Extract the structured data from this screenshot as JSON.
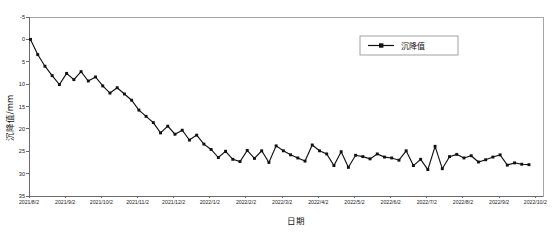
{
  "chart_data": {
    "type": "line",
    "title": "",
    "xlabel": "日期",
    "ylabel": "沉降值/mm",
    "y_inverted": true,
    "ylim": [
      -5,
      35
    ],
    "yticks": [
      -5,
      0,
      5,
      10,
      15,
      20,
      25,
      30,
      35
    ],
    "ytick_labels": [
      "-5",
      "0",
      "5",
      "10",
      "15",
      "20",
      "25",
      "30",
      "35"
    ],
    "grid": false,
    "legend_position": "upper-right",
    "legend": [
      "沉降值"
    ],
    "xtick_labels": [
      "2021/8/2",
      "2021/9/2",
      "2021/10/2",
      "2021/11/2",
      "2021/12/2",
      "2022/1/2",
      "2022/2/2",
      "2022/3/2",
      "2022/4/2",
      "2022/5/2",
      "2022/6/2",
      "2022/7/2",
      "2022/8/2",
      "2022/9/2",
      "2022/10/2"
    ],
    "series": [
      {
        "name": "沉降值",
        "values": [
          0.0,
          3.4,
          6.0,
          8.1,
          10.1,
          7.6,
          9.0,
          7.2,
          9.3,
          8.4,
          10.4,
          12.0,
          10.8,
          12.2,
          13.6,
          15.8,
          17.2,
          18.6,
          20.9,
          19.4,
          21.2,
          20.3,
          22.5,
          21.4,
          23.4,
          24.6,
          26.4,
          25.0,
          26.8,
          27.3,
          24.8,
          26.6,
          24.9,
          27.5,
          23.8,
          24.9,
          25.8,
          26.5,
          27.2,
          23.6,
          24.9,
          25.6,
          28.2,
          25.1,
          28.6,
          25.9,
          26.2,
          26.7,
          25.6,
          26.3,
          26.5,
          27.0,
          24.9,
          28.2,
          26.8,
          29.1,
          23.9,
          28.9,
          26.2,
          25.7,
          26.5,
          26.0,
          27.4,
          26.9,
          26.3,
          25.8,
          28.1,
          27.6,
          27.9,
          28.0
        ]
      }
    ],
    "x_values": [
      "2021/8/2",
      "2021/8/7",
      "2021/8/12",
      "2021/8/17",
      "2021/8/22",
      "2021/8/25",
      "2021/8/28",
      "2021/8/31",
      "2021/9/3",
      "2021/9/6",
      "2021/9/9",
      "2021/9/12",
      "2021/9/15",
      "2021/9/18",
      "2021/9/21",
      "2021/9/24",
      "2021/9/27",
      "2021/9/30",
      "2021/10/3",
      "2021/10/6",
      "2021/10/9",
      "2021/10/12",
      "2021/10/15",
      "2021/10/18",
      "2021/10/21",
      "2021/10/24",
      "2021/10/27",
      "2021/10/30",
      "2021/11/4",
      "2021/11/9",
      "2021/11/14",
      "2021/11/19",
      "2021/11/24",
      "2021/11/29",
      "2021/12/4",
      "2021/12/9",
      "2021/12/14",
      "2021/12/19",
      "2021/12/24",
      "2021/12/29",
      "2022/1/5",
      "2022/1/12",
      "2022/1/19",
      "2022/1/26",
      "2022/2/3",
      "2022/2/10",
      "2022/2/18",
      "2022/2/25",
      "2022/3/5",
      "2022/3/12",
      "2022/3/20",
      "2022/3/28",
      "2022/4/5",
      "2022/4/12",
      "2022/4/20",
      "2022/4/28",
      "2022/5/6",
      "2022/5/14",
      "2022/5/22",
      "2022/5/30",
      "2022/6/10",
      "2022/6/22",
      "2022/7/5",
      "2022/7/18",
      "2022/8/1",
      "2022/8/15",
      "2022/8/29",
      "2022/9/12",
      "2022/9/26",
      "2022/10/2"
    ]
  }
}
